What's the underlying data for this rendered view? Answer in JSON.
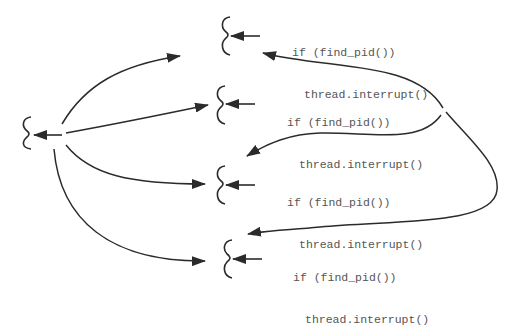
{
  "diagram": {
    "type": "thread-interrupt-fanout",
    "colors": {
      "stroke": "#2b2b2b",
      "text": "#555555",
      "background": "#ffffff"
    },
    "source_thread": {
      "icon": "thread-squiggle-icon"
    },
    "threads": [
      {
        "condition": "if (find_pid())",
        "action": "thread.interrupt()"
      },
      {
        "condition": "if (find_pid())",
        "action": "thread.interrupt()"
      },
      {
        "condition": "if (find_pid())",
        "action": "thread.interrupt()"
      },
      {
        "condition": "if (find_pid())",
        "action": "thread.interrupt()"
      }
    ]
  }
}
